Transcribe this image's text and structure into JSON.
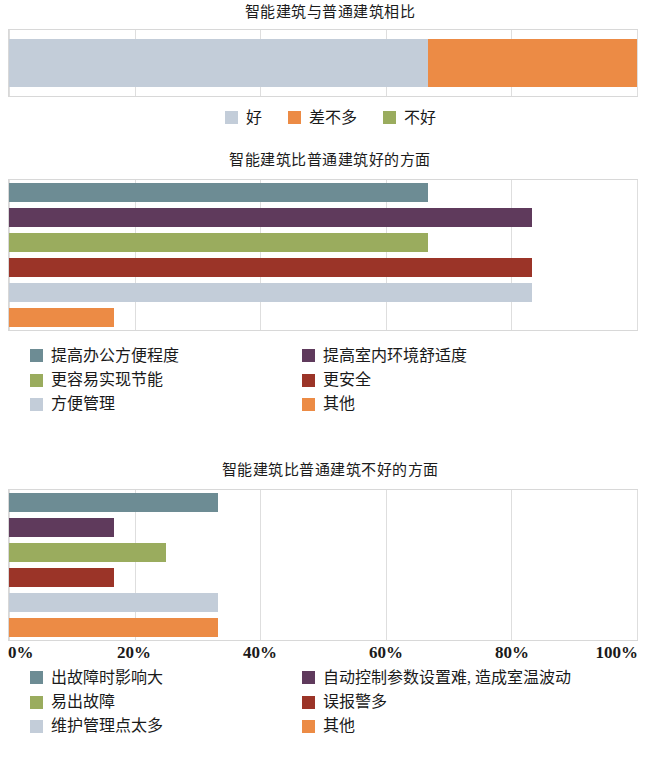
{
  "chart_data": [
    {
      "type": "bar",
      "orientation": "horizontal",
      "stacked": true,
      "title": "智能建筑与普通建筑相比",
      "xlabel": "",
      "ylabel": "",
      "xlim": [
        0,
        100
      ],
      "xticks": [
        "0%",
        "20%",
        "40%",
        "60%",
        "80%",
        "100%"
      ],
      "grid": true,
      "legend_position": "bottom-center",
      "categories": [
        ""
      ],
      "series": [
        {
          "name": "好",
          "values": [
            66.7
          ],
          "color": "#c3cdd9"
        },
        {
          "name": "差不多",
          "values": [
            33.3
          ],
          "color": "#ec8b45"
        },
        {
          "name": "不好",
          "values": [
            0
          ],
          "color": "#9aac5e"
        }
      ]
    },
    {
      "type": "bar",
      "orientation": "horizontal",
      "stacked": false,
      "title": "智能建筑比普通建筑好的方面",
      "xlabel": "",
      "ylabel": "",
      "xlim": [
        0,
        100
      ],
      "xticks": [
        "0%",
        "20%",
        "40%",
        "60%",
        "80%",
        "100%"
      ],
      "grid": true,
      "legend_position": "bottom-left",
      "categories": [
        "提高办公方便程度",
        "提高室内环境舒适度",
        "更容易实现节能",
        "更安全",
        "方便管理",
        "其他"
      ],
      "values": [
        66.7,
        83.3,
        66.7,
        83.3,
        83.3,
        16.7
      ],
      "colors": [
        "#6d8c94",
        "#5f3a5c",
        "#9aac5e",
        "#9b3428",
        "#c3cdd9",
        "#ec8b45"
      ]
    },
    {
      "type": "bar",
      "orientation": "horizontal",
      "stacked": false,
      "title": "智能建筑比普通建筑不好的方面",
      "xlabel": "",
      "ylabel": "",
      "xlim": [
        0,
        100
      ],
      "xticks": [
        "0%",
        "20%",
        "40%",
        "60%",
        "80%",
        "100%"
      ],
      "grid": true,
      "legend_position": "bottom-left",
      "categories": [
        "出故障时影响大",
        "自动控制参数设置难, 造成室温波动",
        "易出故障",
        "误报警多",
        "维护管理点太多",
        "其他"
      ],
      "values": [
        33.3,
        16.7,
        25.0,
        16.7,
        33.3,
        33.3
      ],
      "colors": [
        "#6d8c94",
        "#5f3a5c",
        "#9aac5e",
        "#9b3428",
        "#c3cdd9",
        "#ec8b45"
      ]
    }
  ],
  "chart1": {
    "title": "智能建筑与普通建筑相比",
    "segments": [
      {
        "label": "好",
        "value": 66.7,
        "color": "#c3cdd9"
      },
      {
        "label": "差不多",
        "value": 33.3,
        "color": "#ec8b45"
      },
      {
        "label": "不好",
        "value": 0,
        "color": "#9aac5e"
      }
    ],
    "legend": [
      {
        "label": "好",
        "color": "#c3cdd9"
      },
      {
        "label": "差不多",
        "color": "#ec8b45"
      },
      {
        "label": "不好",
        "color": "#9aac5e"
      }
    ]
  },
  "chart2": {
    "title": "智能建筑比普通建筑好的方面",
    "bars": [
      {
        "label": "提高办公方便程度",
        "value": 66.7,
        "color": "#6d8c94"
      },
      {
        "label": "提高室内环境舒适度",
        "value": 83.3,
        "color": "#5f3a5c"
      },
      {
        "label": "更容易实现节能",
        "value": 66.7,
        "color": "#9aac5e"
      },
      {
        "label": "更安全",
        "value": 83.3,
        "color": "#9b3428"
      },
      {
        "label": "方便管理",
        "value": 83.3,
        "color": "#c3cdd9"
      },
      {
        "label": "其他",
        "value": 16.7,
        "color": "#ec8b45"
      }
    ],
    "legend": [
      {
        "label": "提高办公方便程度",
        "color": "#6d8c94"
      },
      {
        "label": "提高室内环境舒适度",
        "color": "#5f3a5c"
      },
      {
        "label": "更容易实现节能",
        "color": "#9aac5e"
      },
      {
        "label": "更安全",
        "color": "#9b3428"
      },
      {
        "label": "方便管理",
        "color": "#c3cdd9"
      },
      {
        "label": "其他",
        "color": "#ec8b45"
      }
    ]
  },
  "chart3": {
    "title": "智能建筑比普通建筑不好的方面",
    "bars": [
      {
        "label": "出故障时影响大",
        "value": 33.3,
        "color": "#6d8c94"
      },
      {
        "label": "自动控制参数设置难, 造成室温波动",
        "value": 16.7,
        "color": "#5f3a5c"
      },
      {
        "label": "易出故障",
        "value": 25.0,
        "color": "#9aac5e"
      },
      {
        "label": "误报警多",
        "value": 16.7,
        "color": "#9b3428"
      },
      {
        "label": "维护管理点太多",
        "value": 33.3,
        "color": "#c3cdd9"
      },
      {
        "label": "其他",
        "value": 33.3,
        "color": "#ec8b45"
      }
    ],
    "legend": [
      {
        "label": "出故障时影响大",
        "color": "#6d8c94"
      },
      {
        "label": "自动控制参数设置难, 造成室温波动",
        "color": "#5f3a5c"
      },
      {
        "label": "易出故障",
        "color": "#9aac5e"
      },
      {
        "label": "误报警多",
        "color": "#9b3428"
      },
      {
        "label": "维护管理点太多",
        "color": "#c3cdd9"
      },
      {
        "label": "其他",
        "color": "#ec8b45"
      }
    ]
  },
  "axis": {
    "ticks": [
      "0%",
      "20%",
      "40%",
      "60%",
      "80%",
      "100%"
    ],
    "positions": [
      0,
      20,
      40,
      60,
      80,
      100
    ]
  }
}
